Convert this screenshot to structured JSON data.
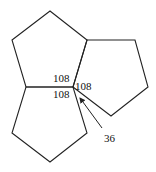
{
  "diagram": {
    "title": "",
    "shapes": [
      {
        "name": "top-pentagon",
        "points": "50,11 87,40 73,87 26,87 12,40"
      },
      {
        "name": "right-pentagon",
        "points": "87,40 135,40 148,87 111,116 73,87"
      },
      {
        "name": "bottom-pentagon",
        "points": "26,87 73,87 87,133 50,162 12,133"
      }
    ],
    "labels": {
      "angle_top": "108",
      "angle_right": "108",
      "angle_bottom": "108",
      "gap_angle": "36"
    },
    "colors": {
      "stroke": "#222222",
      "text": "#111111",
      "background": "#ffffff"
    }
  }
}
